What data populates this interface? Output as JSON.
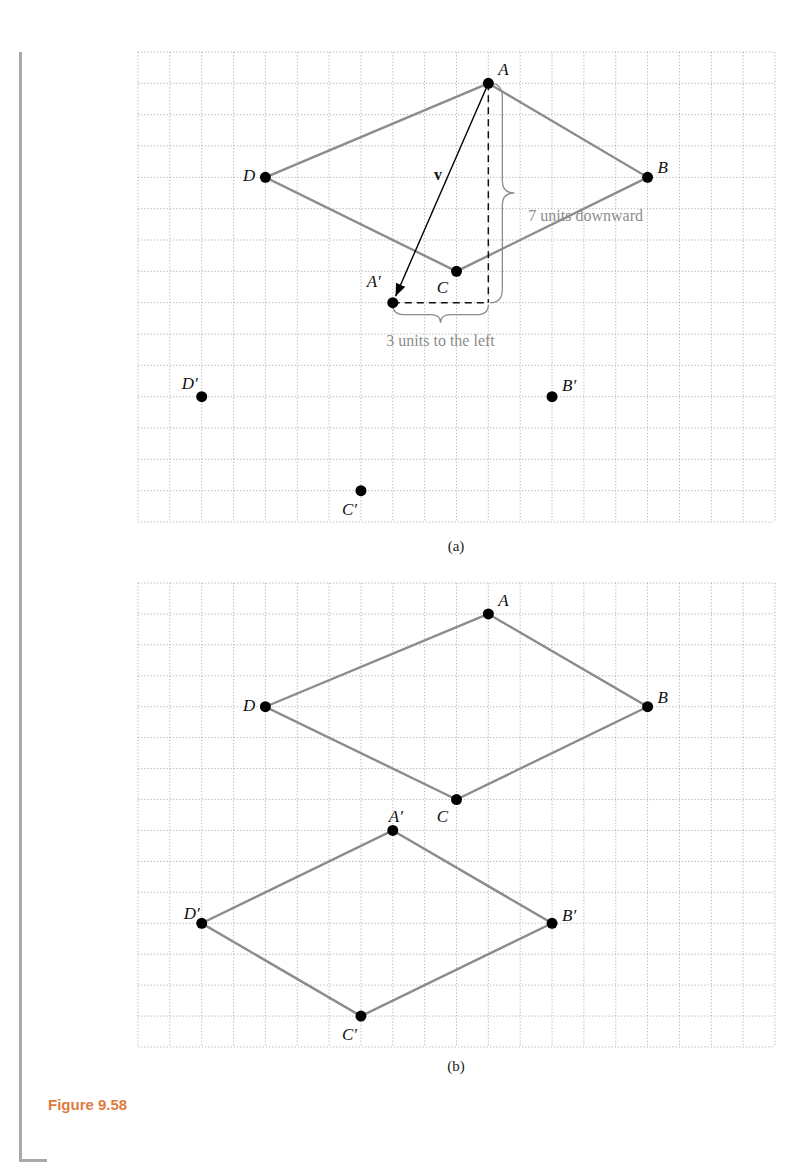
{
  "figure": {
    "caption": "Figure 9.58",
    "colors": {
      "grid": "#a0a0a0",
      "shape": "#8c8c8c",
      "point": "#000000",
      "vector": "#000000",
      "annotation": "#8c8c8c",
      "caption": "#e07b3e",
      "side_bar": "#a9a9a9"
    },
    "panels": [
      {
        "id": "a",
        "label": "(a)",
        "grid": {
          "cols": 20,
          "rows": 15
        },
        "original": [
          {
            "name": "A",
            "col": 11,
            "row": 1
          },
          {
            "name": "B",
            "col": 16,
            "row": 4
          },
          {
            "name": "C",
            "col": 10,
            "row": 7
          },
          {
            "name": "D",
            "col": 4,
            "row": 4
          }
        ],
        "image": [
          {
            "name": "A′",
            "col": 8,
            "row": 8
          },
          {
            "name": "B′",
            "col": 13,
            "row": 11
          },
          {
            "name": "C′",
            "col": 7,
            "row": 14
          },
          {
            "name": "D′",
            "col": 2,
            "row": 11
          }
        ],
        "vector_label": "v",
        "vertical_annotation": "7 units downward",
        "horizontal_annotation": "3 units to the left"
      },
      {
        "id": "b",
        "label": "(b)",
        "grid": {
          "cols": 20,
          "rows": 15
        },
        "original": [
          {
            "name": "A",
            "col": 11,
            "row": 1
          },
          {
            "name": "B",
            "col": 16,
            "row": 4
          },
          {
            "name": "C",
            "col": 10,
            "row": 7
          },
          {
            "name": "D",
            "col": 4,
            "row": 4
          }
        ],
        "image": [
          {
            "name": "A′",
            "col": 8,
            "row": 8
          },
          {
            "name": "B′",
            "col": 13,
            "row": 11
          },
          {
            "name": "C′",
            "col": 7,
            "row": 14
          },
          {
            "name": "D′",
            "col": 2,
            "row": 11
          }
        ]
      }
    ]
  }
}
